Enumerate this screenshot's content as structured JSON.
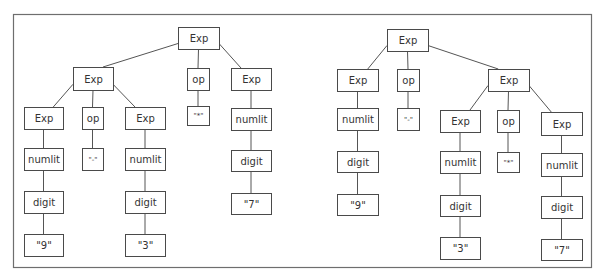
{
  "trees": [
    {
      "name": "left-tree",
      "description": "(9 - 3) * 7",
      "nodes": [
        {
          "id": "L1",
          "label": "Exp",
          "parent": null
        },
        {
          "id": "L2",
          "label": "Exp",
          "parent": "L1"
        },
        {
          "id": "L3",
          "label": "op",
          "parent": "L1"
        },
        {
          "id": "L4",
          "label": "Exp",
          "parent": "L1"
        },
        {
          "id": "L5",
          "label": "Exp",
          "parent": "L2"
        },
        {
          "id": "L6",
          "label": "op",
          "parent": "L2"
        },
        {
          "id": "L7",
          "label": "Exp",
          "parent": "L2"
        },
        {
          "id": "L8",
          "label": "\"*\"",
          "parent": "L3"
        },
        {
          "id": "L9",
          "label": "numlit",
          "parent": "L4"
        },
        {
          "id": "L10",
          "label": "numlit",
          "parent": "L5"
        },
        {
          "id": "L11",
          "label": "\"-\"",
          "parent": "L6"
        },
        {
          "id": "L12",
          "label": "numlit",
          "parent": "L7"
        },
        {
          "id": "L13",
          "label": "digit",
          "parent": "L9"
        },
        {
          "id": "L14",
          "label": "digit",
          "parent": "L10"
        },
        {
          "id": "L15",
          "label": "digit",
          "parent": "L12"
        },
        {
          "id": "L16",
          "label": "\"7\"",
          "parent": "L13"
        },
        {
          "id": "L17",
          "label": "\"9\"",
          "parent": "L14"
        },
        {
          "id": "L18",
          "label": "\"3\"",
          "parent": "L15"
        }
      ]
    },
    {
      "name": "right-tree",
      "description": "9 - (3 * 7)",
      "nodes": [
        {
          "id": "R1",
          "label": "Exp",
          "parent": null
        },
        {
          "id": "R2",
          "label": "Exp",
          "parent": "R1"
        },
        {
          "id": "R3",
          "label": "op",
          "parent": "R1"
        },
        {
          "id": "R4",
          "label": "Exp",
          "parent": "R1"
        },
        {
          "id": "R5",
          "label": "numlit",
          "parent": "R2"
        },
        {
          "id": "R6",
          "label": "\"-\"",
          "parent": "R3"
        },
        {
          "id": "R7",
          "label": "Exp",
          "parent": "R4"
        },
        {
          "id": "R8",
          "label": "op",
          "parent": "R4"
        },
        {
          "id": "R9",
          "label": "Exp",
          "parent": "R4"
        },
        {
          "id": "R10",
          "label": "digit",
          "parent": "R5"
        },
        {
          "id": "R11",
          "label": "numlit",
          "parent": "R7"
        },
        {
          "id": "R12",
          "label": "\"*\"",
          "parent": "R8"
        },
        {
          "id": "R13",
          "label": "numlit",
          "parent": "R9"
        },
        {
          "id": "R14",
          "label": "\"9\"",
          "parent": "R10"
        },
        {
          "id": "R15",
          "label": "digit",
          "parent": "R11"
        },
        {
          "id": "R16",
          "label": "digit",
          "parent": "R13"
        },
        {
          "id": "R17",
          "label": "\"3\"",
          "parent": "R15"
        },
        {
          "id": "R18",
          "label": "\"7\"",
          "parent": "R16"
        }
      ]
    }
  ]
}
